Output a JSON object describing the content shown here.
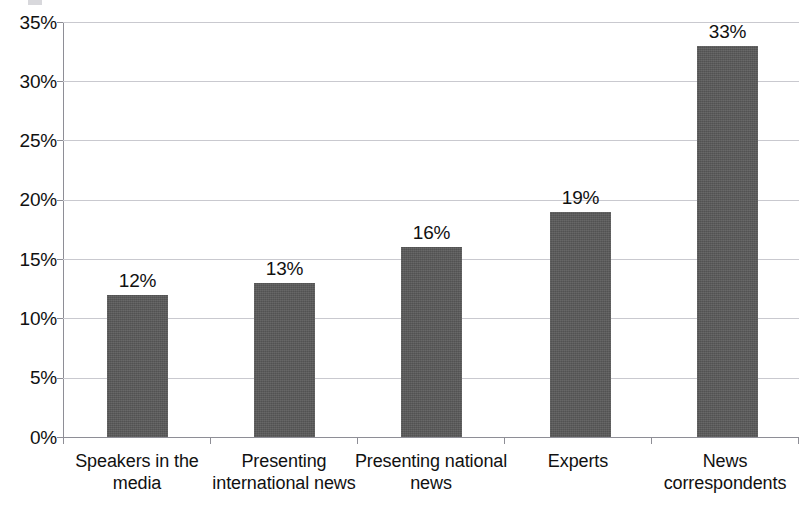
{
  "chart_data": {
    "type": "bar",
    "title": "",
    "xlabel": "",
    "ylabel": "",
    "categories": [
      "Speakers in the media",
      "Presenting international news",
      "Presenting national news",
      "Experts",
      "News correspondents"
    ],
    "values": [
      12,
      13,
      16,
      19,
      33
    ],
    "data_labels": [
      "12%",
      "13%",
      "16%",
      "19%",
      "33%"
    ],
    "ylim": [
      0,
      35
    ],
    "ytick_values": [
      0,
      5,
      10,
      15,
      20,
      25,
      30,
      35
    ],
    "ytick_labels": [
      "0%",
      "5%",
      "10%",
      "15%",
      "20%",
      "25%",
      "30%",
      "35%"
    ],
    "grid": true,
    "legend": null,
    "units": "percent",
    "colors": {
      "bar_fill": "#595959",
      "gridline": "#c9c9cf",
      "axis_line": "#8e8e96",
      "text": "#111111",
      "background": "#ffffff"
    }
  }
}
